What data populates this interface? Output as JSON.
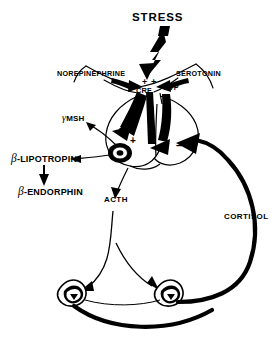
{
  "figure": {
    "title": "STRESS",
    "kind": "hpa-axis-neuroendocrine-diagram",
    "width": 277,
    "height": 341,
    "background_color": "#ffffff",
    "ink_color": "#000000"
  },
  "labels": {
    "stress": "STRESS",
    "norepinephrine": "NOREPINEPHRINE",
    "serotonin": "SEROTONIN",
    "crf": "CRF",
    "avp": "AVP",
    "gamma_msh_prefix": "γ",
    "gamma_msh_text": "MSH",
    "beta_lipotropin_prefix": "β",
    "beta_lipotropin_text": "-LIPOTROPIN",
    "beta_endorphin_prefix": "β",
    "beta_endorphin_text": "-ENDORPHIN",
    "acth": "ACTH",
    "cortisol": "CORTISOL"
  },
  "signs": {
    "plus_a": "+",
    "plus_b": "+",
    "plus_c": "+",
    "plus_d": "+",
    "minus": "–"
  },
  "icons": {
    "lightning": "lightning-bolt-icon",
    "hypothalamus": "hypothalamus-outline-icon",
    "pituitary": "pituitary-gland-icon",
    "corticotroph": "corticotroph-cell-icon",
    "adrenal_left": "adrenal-gland-left-icon",
    "adrenal_right": "adrenal-gland-right-icon"
  }
}
